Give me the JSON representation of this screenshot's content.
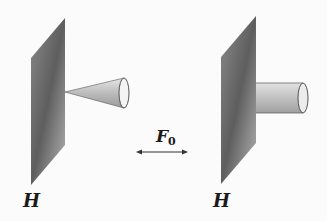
{
  "figure": {
    "left_plate_label": "H",
    "right_plate_label": "H",
    "force_label": "F",
    "force_subscript": "0",
    "left_object": "cone",
    "right_object": "cylinder",
    "arrow": "double-headed-horizontal"
  },
  "colors": {
    "plate_dark": "#555555",
    "plate_light": "#bdbdbd",
    "object_fill": "#c8c8c8",
    "line": "#333333"
  }
}
